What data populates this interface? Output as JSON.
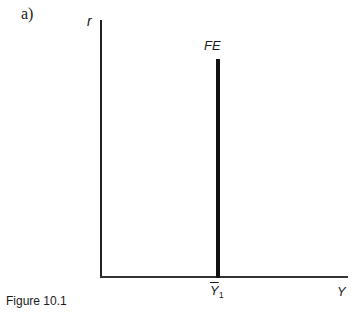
{
  "panel_label": "a)",
  "axes": {
    "y_label": "r",
    "x_label": "Y"
  },
  "curves": [
    {
      "name": "FE",
      "label": "FE",
      "type": "vertical-line",
      "x_label": "Y",
      "x_sub": "1",
      "x_overline": true
    }
  ],
  "tick_label": {
    "symbol": "Y",
    "subscript": "1"
  },
  "caption": "Figure 10.1",
  "colors": {
    "line": "#111111",
    "axis": "#222222",
    "background": "#ffffff"
  }
}
